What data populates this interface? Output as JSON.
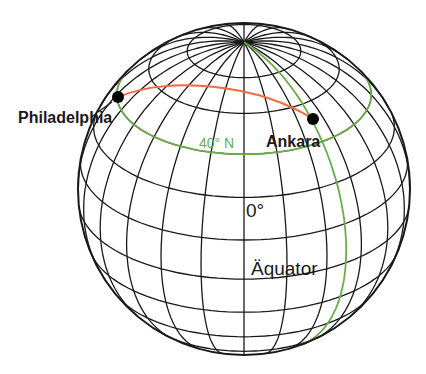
{
  "diagram": {
    "type": "globe-great-circle",
    "colors": {
      "grid": "#1a1a1a",
      "route": "#f06a3c",
      "highlight": "#6aad4a",
      "city_dot": "#000000"
    },
    "labels": {
      "philadelphia": "Philadelphia",
      "ankara": "Ankara",
      "latitude": "40° N",
      "meridian": "0°",
      "equator": "Äquator"
    },
    "cities": [
      {
        "name": "Philadelphia",
        "x": 118,
        "y": 97
      },
      {
        "name": "Ankara",
        "x": 313,
        "y": 119
      }
    ]
  }
}
